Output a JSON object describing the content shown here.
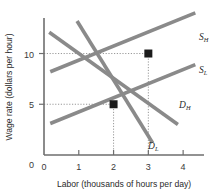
{
  "chart_data": {
    "type": "line",
    "title": "",
    "xlabel": "Labor (thousands of hours per day)",
    "ylabel": "Wage rate (dollars per hour)",
    "xlim": [
      0,
      4.6
    ],
    "ylim": [
      0,
      13.5
    ],
    "xticks": [
      "0",
      "1",
      "2",
      "3",
      "4"
    ],
    "xtick_values": [
      0,
      1,
      2,
      3,
      4
    ],
    "yticks": [
      "0",
      "5",
      "10"
    ],
    "ytick_values": [
      0,
      5,
      10
    ],
    "grid": false,
    "legend_position": "inline-curve-labels",
    "series": [
      {
        "name": "S_L",
        "label": "S",
        "subscript": "L",
        "kind": "supply",
        "x": [
          0.18,
          4.35
        ],
        "y": [
          3.1,
          8.9
        ],
        "color": "#8a8a8a"
      },
      {
        "name": "S_H",
        "label": "S",
        "subscript": "H",
        "kind": "supply",
        "x": [
          0.18,
          4.35
        ],
        "y": [
          8.2,
          14.0
        ],
        "color": "#8a8a8a"
      },
      {
        "name": "D_L",
        "label": "D",
        "subscript": "L",
        "kind": "demand",
        "x": [
          0.95,
          3.12
        ],
        "y": [
          13.2,
          1.2
        ],
        "color": "#8a8a8a"
      },
      {
        "name": "D_H",
        "label": "D",
        "subscript": "H",
        "kind": "demand",
        "x": [
          0.15,
          3.85
        ],
        "y": [
          12.1,
          3.0
        ],
        "color": "#8a8a8a"
      }
    ],
    "points": [
      {
        "name": "equilibrium-low",
        "x": 2,
        "y": 5,
        "marker": "square",
        "color": "#1b1b1b"
      },
      {
        "name": "equilibrium-high",
        "x": 3,
        "y": 10,
        "marker": "square",
        "color": "#1b1b1b"
      }
    ],
    "guides": [
      {
        "name": "guide-wage-5",
        "from": [
          0,
          5
        ],
        "to": [
          2,
          5
        ]
      },
      {
        "name": "guide-labor-2",
        "from": [
          2,
          0
        ],
        "to": [
          2,
          5
        ]
      },
      {
        "name": "guide-wage-10",
        "from": [
          0,
          10
        ],
        "to": [
          3,
          10
        ]
      },
      {
        "name": "guide-labor-3",
        "from": [
          3,
          0
        ],
        "to": [
          3,
          10
        ]
      }
    ]
  },
  "labels": {
    "s_h_main": "S",
    "s_h_sub": "H",
    "s_l_main": "S",
    "s_l_sub": "L",
    "d_h_main": "D",
    "d_h_sub": "H",
    "d_l_main": "D",
    "d_l_sub": "L",
    "x_axis_title": "Labor (thousands of hours per day)",
    "y_axis_title": "Wage rate (dollars per hour)",
    "xtick_0": "0",
    "xtick_1": "1",
    "xtick_2": "2",
    "xtick_3": "3",
    "xtick_4": "4",
    "ytick_0": "0",
    "ytick_5": "5",
    "ytick_10": "10"
  }
}
